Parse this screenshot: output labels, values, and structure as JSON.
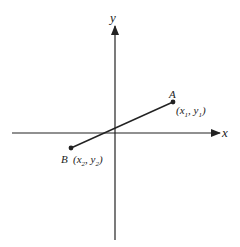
{
  "diagram": {
    "axes": {
      "x_label": "x",
      "y_label": "y"
    },
    "points": [
      {
        "name": "A",
        "coord_label": "(x",
        "sub1": "1",
        "sep": ", y",
        "sub2": "1",
        "close": ")"
      },
      {
        "name": "B",
        "coord_label": "(x",
        "sub1": "2",
        "sep": ", y",
        "sub2": "2",
        "close": ")"
      }
    ],
    "segment": "AB",
    "colors": {
      "stroke": "#222222",
      "background": "#ffffff"
    }
  }
}
